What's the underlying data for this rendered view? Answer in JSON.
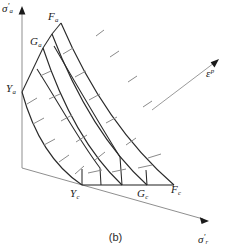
{
  "figure": {
    "caption": "(b)",
    "background_color": "#ffffff",
    "line_color": "#2a2a2a",
    "axis_color": "#8f8f8f",
    "tick_color": "#8a8a8a"
  },
  "axes": [
    {
      "id": "vertical-axis",
      "name": "sigma-a-axis",
      "label_plain": "σ'a",
      "symbol": "σ",
      "prime": "'",
      "subscript": "a",
      "direction": "up",
      "origin": [
        22,
        168
      ],
      "tip": [
        22,
        8
      ]
    },
    {
      "id": "horizontal-axis",
      "name": "sigma-r-axis",
      "label_plain": "σ'r",
      "symbol": "σ",
      "prime": "'",
      "subscript": "r",
      "direction": "down-right",
      "origin": [
        22,
        168
      ],
      "tip": [
        208,
        221
      ]
    },
    {
      "id": "plastic-strain-vector",
      "name": "epsilon-p-vector",
      "label_plain": "εp",
      "symbol": "ε",
      "superscript": "p",
      "direction": "up-right",
      "origin": [
        152,
        110
      ],
      "tip": [
        219,
        60
      ]
    }
  ],
  "surfaces": [
    {
      "id": "yield-surface",
      "key": "Y",
      "axial_label": "Ya",
      "axial_symbol": "Y",
      "axial_subscript": "a",
      "radial_label": "Yc",
      "radial_symbol": "Y",
      "radial_subscript": "c",
      "axial_point": [
        22,
        92
      ],
      "radial_point": [
        82,
        185
      ]
    },
    {
      "id": "intermediate-surface",
      "key": "G",
      "axial_label": "Ga",
      "axial_symbol": "G",
      "axial_subscript": "a",
      "radial_label": "Gc",
      "radial_symbol": "G",
      "radial_subscript": "c",
      "axial_point": [
        43,
        48
      ],
      "radial_point": [
        147,
        185
      ]
    },
    {
      "id": "failure-surface",
      "key": "F",
      "axial_label": "Fa",
      "axial_symbol": "F",
      "axial_subscript": "a",
      "radial_label": "Fc",
      "radial_symbol": "F",
      "radial_subscript": "c",
      "axial_point": [
        61,
        23
      ],
      "radial_point": [
        174,
        185
      ]
    }
  ],
  "geometry": {
    "arc_count": 4,
    "radial_divider_count": 4,
    "tick_count": 18,
    "note": "nested quarter-arc bounding surfaces with radial dividers and hatch ticks"
  }
}
